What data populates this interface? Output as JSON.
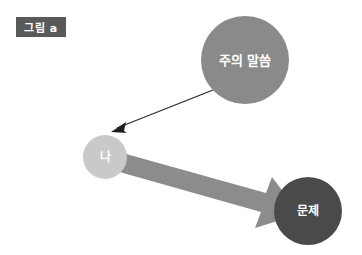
{
  "figure": {
    "badge": {
      "text": "그림 a",
      "bg_color": "#595959",
      "text_color": "#ffffff"
    },
    "background_color": "#ffffff",
    "nodes": [
      {
        "id": "caution",
        "label": "주의 말씀",
        "shape": "circle",
        "fill_color": "#8a8a8a",
        "text_color": "#ffffff",
        "cx": 245,
        "cy": 60,
        "r": 44
      },
      {
        "id": "self",
        "label": "나",
        "shape": "circle",
        "fill_color": "#c9c9c9",
        "text_color": "#ffffff",
        "cx": 105,
        "cy": 157,
        "r": 22
      },
      {
        "id": "problem",
        "label": "문제",
        "shape": "circle",
        "fill_color": "#4a4a4a",
        "text_color": "#ffffff",
        "cx": 308,
        "cy": 211,
        "r": 34
      }
    ],
    "connectors": [
      {
        "id": "caution-to-self",
        "style": "thin-line-arrow",
        "color": "#2b2b2b",
        "from": "caution",
        "to": "self",
        "x1": 213,
        "y1": 90,
        "x2": 112,
        "y2": 131
      },
      {
        "id": "self-to-problem",
        "style": "thick-block-arrow",
        "color": "#8c8c8c",
        "from": "self",
        "to": "problem",
        "x1": 120,
        "y1": 165,
        "x2": 288,
        "y2": 212
      }
    ]
  }
}
